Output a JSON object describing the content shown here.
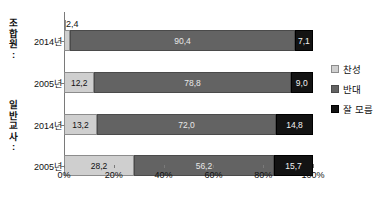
{
  "chart_data": {
    "type": "bar",
    "subtype": "horizontal-100-percent-stacked",
    "title": "",
    "xlabel": "",
    "ylabel": "",
    "xlim": [
      0,
      100
    ],
    "xticks": [
      "0%",
      "20%",
      "40%",
      "60%",
      "80%",
      "100%"
    ],
    "xtick_values": [
      0,
      20,
      40,
      60,
      80,
      100
    ],
    "grid": false,
    "legend_position": "right",
    "categories": [
      "2014년",
      "2005년",
      "2014년",
      "2005년"
    ],
    "groups": [
      {
        "label": "조합원:",
        "chars": [
          "조",
          "합",
          "원",
          ":"
        ],
        "categories": [
          "2014년",
          "2005년"
        ]
      },
      {
        "label": "일반 교사:",
        "chars": [
          "일",
          "반",
          "교",
          "사",
          ":"
        ],
        "categories": [
          "2014년",
          "2005년"
        ]
      }
    ],
    "series": [
      {
        "name": "찬성",
        "color": "#cfcfcf",
        "values": [
          2.4,
          12.2,
          13.2,
          28.1
        ]
      },
      {
        "name": "반대",
        "color": "#636363",
        "values": [
          90.4,
          78.8,
          72.0,
          56.2
        ]
      },
      {
        "name": "잘 모름",
        "color": "#131313",
        "values": [
          7.1,
          9.0,
          14.8,
          15.7
        ]
      }
    ],
    "rows": [
      {
        "group": "조합원:",
        "category": "2014년",
        "segments": [
          {
            "name": "찬성",
            "value": 2.4,
            "label": "2,4",
            "label_outside": true
          },
          {
            "name": "반대",
            "value": 90.4,
            "label": "90,4",
            "label_outside": false
          },
          {
            "name": "잘 모름",
            "value": 7.1,
            "label": "7,1",
            "label_outside": false
          }
        ]
      },
      {
        "group": "조합원:",
        "category": "2005년",
        "segments": [
          {
            "name": "찬성",
            "value": 12.2,
            "label": "12,2",
            "label_outside": false
          },
          {
            "name": "반대",
            "value": 78.8,
            "label": "78,8",
            "label_outside": false
          },
          {
            "name": "잘 모름",
            "value": 9.0,
            "label": "9,0",
            "label_outside": false
          }
        ]
      },
      {
        "group": "일반 교사:",
        "category": "2014년",
        "segments": [
          {
            "name": "찬성",
            "value": 13.2,
            "label": "13,2",
            "label_outside": false
          },
          {
            "name": "반대",
            "value": 72.0,
            "label": "72,0",
            "label_outside": false
          },
          {
            "name": "잘 모름",
            "value": 14.8,
            "label": "14,8",
            "label_outside": false
          }
        ]
      },
      {
        "group": "일반 교사:",
        "category": "2005년",
        "segments": [
          {
            "name": "찬성",
            "value": 28.1,
            "label": "28,2",
            "label_outside": false
          },
          {
            "name": "반대",
            "value": 56.2,
            "label": "56,2",
            "label_outside": false
          },
          {
            "name": "잘 모름",
            "value": 15.7,
            "label": "15,7",
            "label_outside": false
          }
        ]
      }
    ],
    "legend": [
      {
        "label": "찬성",
        "color": "#cfcfcf"
      },
      {
        "label": "반대",
        "color": "#636363"
      },
      {
        "label": "잘 모름",
        "color": "#131313"
      }
    ]
  }
}
